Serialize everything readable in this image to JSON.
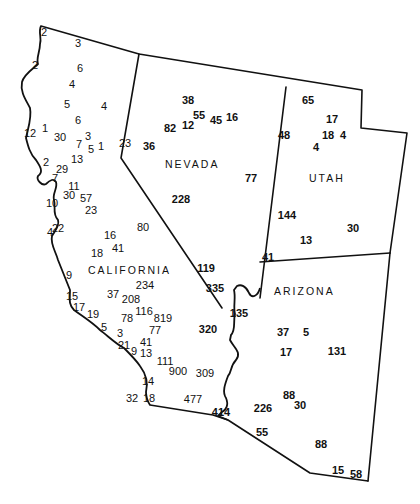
{
  "map": {
    "states": [
      {
        "name": "NEVADA",
        "x": 165,
        "y": 168
      },
      {
        "name": "UTAH",
        "x": 309,
        "y": 182
      },
      {
        "name": "CALIFORNIA",
        "x": 88,
        "y": 274
      },
      {
        "name": "ARIZONA",
        "x": 274,
        "y": 295
      }
    ],
    "colors": {
      "ink": "#111111",
      "background": "#ffffff"
    },
    "values": {
      "california": [
        {
          "v": "2",
          "x": 44,
          "y": 36
        },
        {
          "v": "3",
          "x": 78,
          "y": 47
        },
        {
          "v": "2",
          "x": 35,
          "y": 69
        },
        {
          "v": "6",
          "x": 80,
          "y": 72
        },
        {
          "v": "4",
          "x": 72,
          "y": 88
        },
        {
          "v": "5",
          "x": 67,
          "y": 108
        },
        {
          "v": "4",
          "x": 104,
          "y": 110
        },
        {
          "v": "6",
          "x": 78,
          "y": 124
        },
        {
          "v": "12",
          "x": 30,
          "y": 137
        },
        {
          "v": "1",
          "x": 45,
          "y": 132
        },
        {
          "v": "30",
          "x": 60,
          "y": 141
        },
        {
          "v": "3",
          "x": 88,
          "y": 140
        },
        {
          "v": "7",
          "x": 79,
          "y": 148
        },
        {
          "v": "5",
          "x": 91,
          "y": 153
        },
        {
          "v": "1",
          "x": 101,
          "y": 150
        },
        {
          "v": "23",
          "x": 125,
          "y": 147
        },
        {
          "v": "2",
          "x": 46,
          "y": 166
        },
        {
          "v": "29",
          "x": 62,
          "y": 173
        },
        {
          "v": "13",
          "x": 77,
          "y": 163
        },
        {
          "v": "7",
          "x": 55,
          "y": 182
        },
        {
          "v": "11",
          "x": 74,
          "y": 190
        },
        {
          "v": "30",
          "x": 69,
          "y": 199
        },
        {
          "v": "57",
          "x": 86,
          "y": 202
        },
        {
          "v": "10",
          "x": 52,
          "y": 207
        },
        {
          "v": "23",
          "x": 91,
          "y": 214
        },
        {
          "v": "4",
          "x": 50,
          "y": 236
        },
        {
          "v": "22",
          "x": 58,
          "y": 232
        },
        {
          "v": "80",
          "x": 143,
          "y": 231
        },
        {
          "v": "16",
          "x": 110,
          "y": 239
        },
        {
          "v": "18",
          "x": 97,
          "y": 257
        },
        {
          "v": "41",
          "x": 118,
          "y": 252
        },
        {
          "v": "9",
          "x": 69,
          "y": 279
        },
        {
          "v": "15",
          "x": 72,
          "y": 300
        },
        {
          "v": "37",
          "x": 113,
          "y": 298
        },
        {
          "v": "208",
          "x": 131,
          "y": 303
        },
        {
          "v": "234",
          "x": 145,
          "y": 289
        },
        {
          "v": "17",
          "x": 79,
          "y": 311
        },
        {
          "v": "19",
          "x": 93,
          "y": 318
        },
        {
          "v": "116",
          "x": 144,
          "y": 315
        },
        {
          "v": "78",
          "x": 127,
          "y": 322
        },
        {
          "v": "819",
          "x": 163,
          "y": 322
        },
        {
          "v": "5",
          "x": 104,
          "y": 331
        },
        {
          "v": "3",
          "x": 120,
          "y": 337
        },
        {
          "v": "77",
          "x": 155,
          "y": 334
        },
        {
          "v": "41",
          "x": 146,
          "y": 346
        },
        {
          "v": "21",
          "x": 124,
          "y": 349
        },
        {
          "v": "9",
          "x": 134,
          "y": 355
        },
        {
          "v": "13",
          "x": 146,
          "y": 357
        },
        {
          "v": "111",
          "x": 165,
          "y": 365
        },
        {
          "v": "900",
          "x": 178,
          "y": 375
        },
        {
          "v": "309",
          "x": 205,
          "y": 377
        },
        {
          "v": "14",
          "x": 148,
          "y": 385
        },
        {
          "v": "32",
          "x": 132,
          "y": 402
        },
        {
          "v": "18",
          "x": 149,
          "y": 402
        },
        {
          "v": "477",
          "x": 193,
          "y": 403
        }
      ],
      "nevada": [
        {
          "v": "38",
          "x": 188,
          "y": 104
        },
        {
          "v": "82",
          "x": 170,
          "y": 132
        },
        {
          "v": "12",
          "x": 188,
          "y": 129
        },
        {
          "v": "55",
          "x": 199,
          "y": 119
        },
        {
          "v": "45",
          "x": 216,
          "y": 124
        },
        {
          "v": "16",
          "x": 232,
          "y": 121
        },
        {
          "v": "36",
          "x": 149,
          "y": 150
        },
        {
          "v": "77",
          "x": 251,
          "y": 182
        },
        {
          "v": "228",
          "x": 181,
          "y": 203
        },
        {
          "v": "119",
          "x": 206,
          "y": 272
        },
        {
          "v": "335",
          "x": 215,
          "y": 292
        },
        {
          "v": "320",
          "x": 208,
          "y": 333
        }
      ],
      "utah": [
        {
          "v": "65",
          "x": 308,
          "y": 104
        },
        {
          "v": "17",
          "x": 332,
          "y": 123
        },
        {
          "v": "48",
          "x": 284,
          "y": 139
        },
        {
          "v": "18",
          "x": 328,
          "y": 139
        },
        {
          "v": "4",
          "x": 343,
          "y": 139
        },
        {
          "v": "4",
          "x": 316,
          "y": 151
        },
        {
          "v": "144",
          "x": 287,
          "y": 219
        },
        {
          "v": "13",
          "x": 306,
          "y": 244
        },
        {
          "v": "30",
          "x": 353,
          "y": 232
        },
        {
          "v": "41",
          "x": 268,
          "y": 261
        }
      ],
      "arizona": [
        {
          "v": "135",
          "x": 239,
          "y": 317
        },
        {
          "v": "37",
          "x": 283,
          "y": 336
        },
        {
          "v": "5",
          "x": 306,
          "y": 336
        },
        {
          "v": "17",
          "x": 286,
          "y": 356
        },
        {
          "v": "131",
          "x": 337,
          "y": 355
        },
        {
          "v": "414",
          "x": 221,
          "y": 416
        },
        {
          "v": "88",
          "x": 289,
          "y": 399
        },
        {
          "v": "30",
          "x": 300,
          "y": 409
        },
        {
          "v": "226",
          "x": 263,
          "y": 412
        },
        {
          "v": "55",
          "x": 262,
          "y": 436
        },
        {
          "v": "88",
          "x": 321,
          "y": 448
        },
        {
          "v": "15",
          "x": 338,
          "y": 474
        },
        {
          "v": "58",
          "x": 356,
          "y": 478
        }
      ]
    }
  }
}
